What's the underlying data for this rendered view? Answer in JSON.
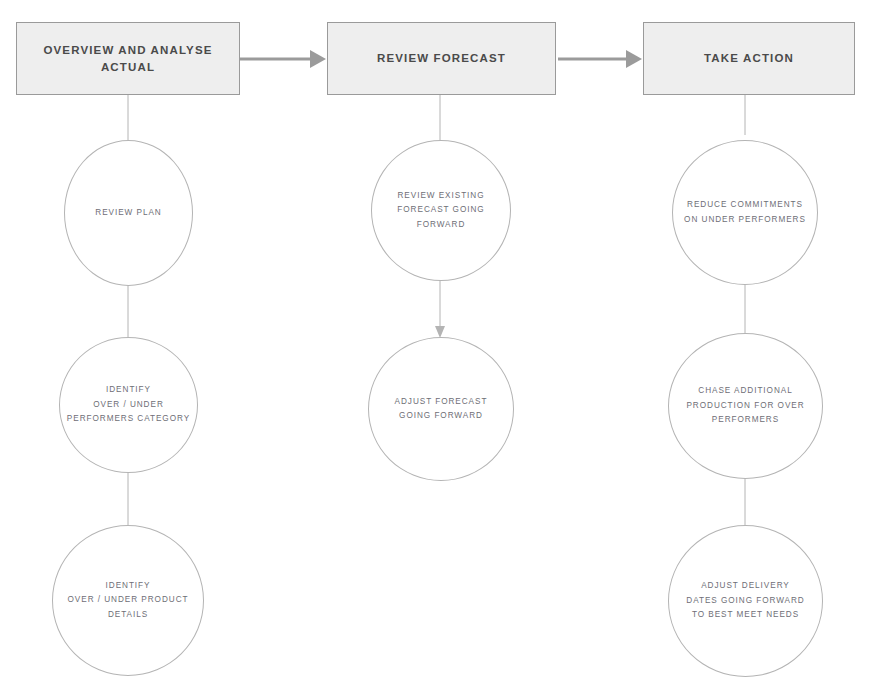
{
  "diagram": {
    "type": "flowchart",
    "colors": {
      "box_fill": "#eeeeee",
      "box_border": "#9a9a9a",
      "box_text": "#4a4a4a",
      "circle_border": "#b4b4b4",
      "circle_text": "#6e6e76",
      "connector": "#b4b4b4",
      "arrow": "#9b9b9b",
      "background": "#ffffff"
    },
    "columns": [
      {
        "id": "column-1",
        "header": {
          "label": "OVERVIEW AND ANALYSE ACTUAL"
        },
        "nodes": [
          {
            "id": "node-review-plan",
            "label": "REVIEW PLAN"
          },
          {
            "id": "node-identify-performers-category",
            "label": "IDENTIFY\nOVER / UNDER\nPERFORMERS CATEGORY"
          },
          {
            "id": "node-identify-product-details",
            "label": "IDENTIFY\nOVER / UNDER PRODUCT\nDETAILS"
          }
        ]
      },
      {
        "id": "column-2",
        "header": {
          "label": "REVIEW FORECAST"
        },
        "nodes": [
          {
            "id": "node-review-existing-forecast",
            "label": "REVIEW EXISTING\nFORECAST GOING\nFORWARD"
          },
          {
            "id": "node-adjust-forecast",
            "label": "ADJUST FORECAST\nGOING FORWARD"
          }
        ]
      },
      {
        "id": "column-3",
        "header": {
          "label": "TAKE ACTION"
        },
        "nodes": [
          {
            "id": "node-reduce-commitments",
            "label": "REDUCE COMMITMENTS\nON UNDER PERFORMERS"
          },
          {
            "id": "node-chase-additional-production",
            "label": "CHASE ADDITIONAL\nPRODUCTION FOR OVER\nPERFORMERS"
          },
          {
            "id": "node-adjust-delivery-dates",
            "label": "ADJUST DELIVERY\nDATES GOING FORWARD\nTO BEST MEET NEEDS"
          }
        ]
      }
    ],
    "connectors": [
      {
        "id": "arrow-stage1-to-stage2",
        "kind": "horizontal-arrow",
        "from": "column-1-header",
        "to": "column-2-header"
      },
      {
        "id": "arrow-stage2-to-stage3",
        "kind": "horizontal-arrow",
        "from": "column-2-header",
        "to": "column-3-header"
      },
      {
        "id": "line-c1-header-to-node1",
        "kind": "vertical-line",
        "from": "column-1-header",
        "to": "node-review-plan"
      },
      {
        "id": "line-c1-node1-to-node2",
        "kind": "vertical-line",
        "from": "node-review-plan",
        "to": "node-identify-performers-category"
      },
      {
        "id": "line-c1-node2-to-node3",
        "kind": "vertical-line",
        "from": "node-identify-performers-category",
        "to": "node-identify-product-details"
      },
      {
        "id": "line-c2-header-to-node1",
        "kind": "vertical-line",
        "from": "column-2-header",
        "to": "node-review-existing-forecast"
      },
      {
        "id": "arrow-c2-node1-to-node2",
        "kind": "vertical-arrow",
        "from": "node-review-existing-forecast",
        "to": "node-adjust-forecast"
      },
      {
        "id": "line-c3-header-to-node1",
        "kind": "vertical-line",
        "from": "column-3-header",
        "to": "node-reduce-commitments"
      },
      {
        "id": "line-c3-node1-to-node2",
        "kind": "vertical-line",
        "from": "node-reduce-commitments",
        "to": "node-chase-additional-production"
      },
      {
        "id": "line-c3-node2-to-node3",
        "kind": "vertical-line",
        "from": "node-chase-additional-production",
        "to": "node-adjust-delivery-dates"
      }
    ]
  }
}
